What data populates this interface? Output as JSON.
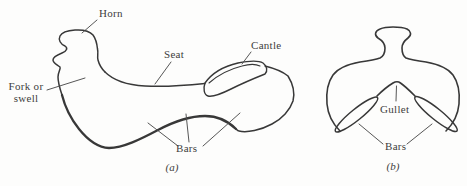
{
  "figure": {
    "colors": {
      "ink": "#383838",
      "leader_line": "#4d4d4d",
      "text": "#3d3d3d",
      "background": "#fdfdfc"
    },
    "panel_a": {
      "caption": "(a)",
      "labels": {
        "horn": "Horn",
        "seat": "Seat",
        "cantle": "Cantle",
        "fork_line1": "Fork or",
        "fork_line2": "swell",
        "bars": "Bars"
      }
    },
    "panel_b": {
      "caption": "(b)",
      "labels": {
        "gullet": "Gullet",
        "bars": "Bars"
      }
    }
  }
}
